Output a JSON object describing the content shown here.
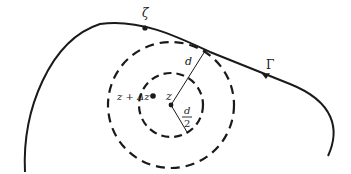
{
  "figure": {
    "colors": {
      "stroke": "#1a1a1a",
      "background": "#ffffff"
    },
    "contour": {
      "label": "Γ",
      "point_label": "ζ"
    },
    "center": {
      "label": "z"
    },
    "nearby_point": {
      "label": "z + Δz"
    },
    "outer_radius": {
      "label": "d"
    },
    "inner_radius": {
      "numerator": "d",
      "denominator": "2"
    }
  }
}
